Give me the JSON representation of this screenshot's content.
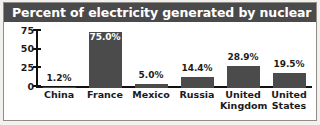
{
  "figure": {
    "title": "Percent of electricity generated by nuclear power",
    "title_color": "#ffffff",
    "title_bar_color": "#4a4a4a",
    "background_color": "#ffffff",
    "border_color": "#8e8d8a"
  },
  "chart_data": {
    "type": "bar",
    "title": "Percent of electricity generated by nuclear power",
    "xlabel": "",
    "ylabel": "",
    "ylim": [
      0,
      75
    ],
    "yticks": [
      0,
      25,
      50,
      75
    ],
    "ytick_labels": [
      "0",
      "25",
      "50",
      "75"
    ],
    "grid": false,
    "legend": "none",
    "bar_color": "#4b4b4b",
    "categories": [
      "China",
      "France",
      "Mexico",
      "Russia",
      "United Kingdom",
      "United States"
    ],
    "values": [
      1.2,
      75.0,
      5.0,
      14.4,
      28.9,
      19.5
    ],
    "data_labels": [
      "1.2%",
      "75.0%",
      "5.0%",
      "14.4%",
      "28.9%",
      "19.5%"
    ],
    "label_placement": [
      "above",
      "inside",
      "above",
      "above",
      "above",
      "above"
    ],
    "bars": [
      {
        "category": "China",
        "category_lines": "China",
        "value": 1.2,
        "label": "1.2%",
        "placement": "above"
      },
      {
        "category": "France",
        "category_lines": "France",
        "value": 75.0,
        "label": "75.0%",
        "placement": "inside"
      },
      {
        "category": "Mexico",
        "category_lines": "Mexico",
        "value": 5.0,
        "label": "5.0%",
        "placement": "above"
      },
      {
        "category": "Russia",
        "category_lines": "Russia",
        "value": 14.4,
        "label": "14.4%",
        "placement": "above"
      },
      {
        "category": "United Kingdom",
        "category_lines": "United\nKingdom",
        "value": 28.9,
        "label": "28.9%",
        "placement": "above"
      },
      {
        "category": "United States",
        "category_lines": "United\nStates",
        "value": 19.5,
        "label": "19.5%",
        "placement": "above"
      }
    ]
  }
}
